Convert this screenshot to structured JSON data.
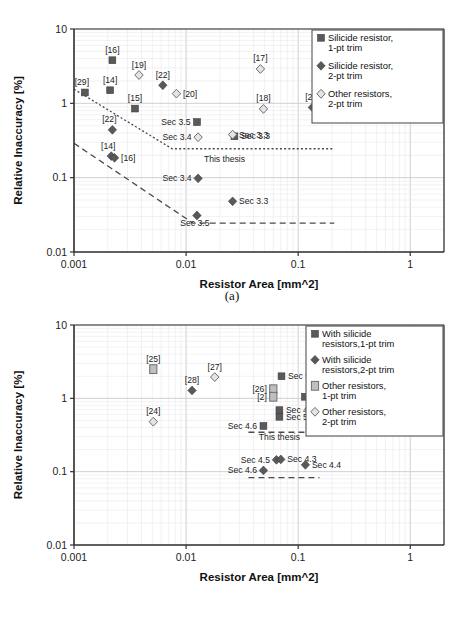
{
  "figure_a": {
    "caption": "(a)",
    "xlabel": "Resistor Area [mm^2]",
    "ylabel": "Relative Inaccuracy [%]",
    "xticks": [
      "0.001",
      "0.01",
      "0.1",
      "1"
    ],
    "yticks": [
      "10",
      "1",
      "0.1",
      "0.01"
    ],
    "thesis_note": "This thesis",
    "legend": [
      {
        "marker": "square-dark",
        "line1": "Silicide resistor,",
        "line2": "1-pt trim"
      },
      {
        "marker": "diamond-dark",
        "line1": "Silicide resistor,",
        "line2": "2-pt trim"
      },
      {
        "marker": "diamond-light",
        "line1": "Other resistors,",
        "line2": "2-pt trim"
      }
    ]
  },
  "figure_b": {
    "caption": "(b)",
    "xlabel": "Resistor Area [mm^2]",
    "ylabel": "Relative Inaccuracy [%]",
    "xticks": [
      "0.001",
      "0.01",
      "0.1",
      "1"
    ],
    "yticks": [
      "10",
      "1",
      "0.1",
      "0.01"
    ],
    "thesis_note": "This thesis",
    "legend": [
      {
        "marker": "square-dark",
        "line1": "With silicide",
        "line2": "resistors,1-pt trim"
      },
      {
        "marker": "diamond-dark",
        "line1": "With silicide",
        "line2": "resistors,2-pt trim"
      },
      {
        "marker": "square-light",
        "line1": "Other resistors,",
        "line2": "1-pt trim"
      },
      {
        "marker": "diamond-light",
        "line1": "Other resistors,",
        "line2": "2-pt trim"
      }
    ]
  },
  "colors": {
    "dark_marker": "#595959",
    "light_marker": "#bfbfbf",
    "axis": "#404040",
    "grid": "#e8e8ec",
    "text": "#1a1a1a"
  },
  "chart_data": [
    {
      "type": "scatter",
      "id": "a",
      "title": "(a)",
      "xlabel": "Resistor Area [mm^2]",
      "ylabel": "Relative Inaccuracy [%]",
      "xscale": "log",
      "yscale": "log",
      "xlim": [
        0.001,
        2.0
      ],
      "ylim": [
        0.01,
        10
      ],
      "grid": true,
      "legend_position": "top-right",
      "series": [
        {
          "name": "Silicide resistor, 1-pt trim",
          "marker": "square-dark",
          "points": [
            {
              "x": 0.00125,
              "y": 1.4,
              "label": "[29]",
              "label_pos": "above-left"
            },
            {
              "x": 0.0021,
              "y": 1.5,
              "label": "[14]",
              "label_pos": "above"
            },
            {
              "x": 0.0022,
              "y": 3.8,
              "label": "[16]",
              "label_pos": "above"
            },
            {
              "x": 0.0035,
              "y": 0.85,
              "label": "[15]",
              "label_pos": "above"
            },
            {
              "x": 0.0125,
              "y": 0.56,
              "label": "Sec 3.5",
              "label_pos": "left"
            },
            {
              "x": 0.027,
              "y": 0.36,
              "label": "Sec 3.3",
              "label_pos": "right"
            }
          ]
        },
        {
          "name": "Silicide resistor, 2-pt trim",
          "marker": "diamond-dark",
          "points": [
            {
              "x": 0.0022,
              "y": 0.44,
              "label": "[22]",
              "label_pos": "above-left"
            },
            {
              "x": 0.00215,
              "y": 0.195,
              "label": "[14]",
              "label_pos": "above-left"
            },
            {
              "x": 0.0023,
              "y": 0.185,
              "label": "[16]",
              "label_pos": "right"
            },
            {
              "x": 0.0062,
              "y": 1.75,
              "label": "[22]",
              "label_pos": "above"
            },
            {
              "x": 0.134,
              "y": 0.88,
              "label": "[21]",
              "label_pos": "above"
            },
            {
              "x": 0.0128,
              "y": 0.098,
              "label": "Sec 3.4",
              "label_pos": "left"
            },
            {
              "x": 0.026,
              "y": 0.048,
              "label": "Sec 3.3",
              "label_pos": "right"
            },
            {
              "x": 0.0125,
              "y": 0.031,
              "label": "Sec 3.5",
              "label_pos": "below"
            }
          ]
        },
        {
          "name": "Other resistors, 2-pt trim",
          "marker": "diamond-light",
          "points": [
            {
              "x": 0.0038,
              "y": 2.4,
              "label": "[19]",
              "label_pos": "above"
            },
            {
              "x": 0.0082,
              "y": 1.35,
              "label": "[20]",
              "label_pos": "right"
            },
            {
              "x": 0.046,
              "y": 2.9,
              "label": "[17]",
              "label_pos": "above"
            },
            {
              "x": 0.049,
              "y": 0.84,
              "label": "[18]",
              "label_pos": "above"
            },
            {
              "x": 0.0128,
              "y": 0.35,
              "label": "Sec 3.4",
              "label_pos": "left"
            },
            {
              "x": 0.026,
              "y": 0.38,
              "label": "Sec 3.3",
              "label_pos": "right"
            }
          ]
        }
      ],
      "trend_lines": [
        {
          "name": "1-pt trim bound",
          "style": "dotted",
          "vertices": [
            {
              "x": 0.001,
              "y": 1.55
            },
            {
              "x": 0.0075,
              "y": 0.245
            },
            {
              "x": 0.21,
              "y": 0.245
            }
          ]
        },
        {
          "name": "2-pt trim bound",
          "style": "dashed",
          "vertices": [
            {
              "x": 0.001,
              "y": 0.29
            },
            {
              "x": 0.0115,
              "y": 0.0245
            },
            {
              "x": 0.21,
              "y": 0.0245
            }
          ]
        }
      ],
      "annotations": [
        {
          "text": "This thesis",
          "x": 0.022,
          "y": 0.16
        }
      ]
    },
    {
      "type": "scatter",
      "id": "b",
      "title": "(b)",
      "xlabel": "Resistor Area [mm^2]",
      "ylabel": "Relative Inaccuracy [%]",
      "xscale": "log",
      "yscale": "log",
      "xlim": [
        0.001,
        2.0
      ],
      "ylim": [
        0.01,
        10
      ],
      "grid": true,
      "legend_position": "top-right",
      "series": [
        {
          "name": "With silicide resistors, 1-pt trim",
          "marker": "square-dark",
          "points": [
            {
              "x": 0.071,
              "y": 2.0,
              "label": "Sec 5.2",
              "label_pos": "right"
            },
            {
              "x": 0.115,
              "y": 1.05,
              "label": "Sec 4.4",
              "label_pos": "right"
            },
            {
              "x": 0.068,
              "y": 0.69,
              "label": "Sec 4.3",
              "label_pos": "right"
            },
            {
              "x": 0.068,
              "y": 0.56,
              "label": "Sec 5.3",
              "label_pos": "right"
            },
            {
              "x": 0.049,
              "y": 0.42,
              "label": "Sec 4.6",
              "label_pos": "left"
            }
          ]
        },
        {
          "name": "With silicide resistors, 2-pt trim",
          "marker": "diamond-dark",
          "points": [
            {
              "x": 0.0113,
              "y": 1.28,
              "label": "[28]",
              "label_pos": "above"
            },
            {
              "x": 0.064,
              "y": 0.145,
              "label": "Sec 4.5",
              "label_pos": "left"
            },
            {
              "x": 0.07,
              "y": 0.147,
              "label": "Sec 4.3",
              "label_pos": "right"
            },
            {
              "x": 0.116,
              "y": 0.124,
              "label": "Sec 4.4",
              "label_pos": "right"
            },
            {
              "x": 0.049,
              "y": 0.104,
              "label": "Sec 4.6",
              "label_pos": "left"
            }
          ]
        },
        {
          "name": "Other resistors, 1-pt trim",
          "marker": "square-light",
          "points": [
            {
              "x": 0.0051,
              "y": 2.5,
              "label": "[25]",
              "label_pos": "above"
            },
            {
              "x": 0.06,
              "y": 1.33,
              "label": "[26]",
              "label_pos": "left"
            },
            {
              "x": 0.06,
              "y": 1.05,
              "label": "[2]",
              "label_pos": "left"
            }
          ]
        },
        {
          "name": "Other resistors, 2-pt trim",
          "marker": "diamond-light",
          "points": [
            {
              "x": 0.018,
              "y": 1.95,
              "label": "[27]",
              "label_pos": "above"
            },
            {
              "x": 0.0051,
              "y": 0.48,
              "label": "[24]",
              "label_pos": "above"
            }
          ]
        }
      ],
      "trend_lines": [
        {
          "name": "1-pt trim bound",
          "style": "dashed",
          "vertices": [
            {
              "x": 0.036,
              "y": 0.345
            },
            {
              "x": 0.165,
              "y": 0.345
            }
          ]
        },
        {
          "name": "2-pt trim bound",
          "style": "dashed",
          "vertices": [
            {
              "x": 0.036,
              "y": 0.083
            },
            {
              "x": 0.155,
              "y": 0.083
            }
          ]
        }
      ],
      "annotations": [
        {
          "text": "This thesis",
          "x": 0.068,
          "y": 0.27
        }
      ]
    }
  ]
}
